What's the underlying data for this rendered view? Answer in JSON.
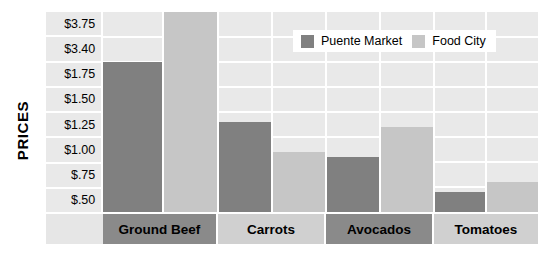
{
  "chart_data": {
    "type": "bar",
    "title": "",
    "subtitle": "",
    "xlabel": "",
    "ylabel": "PRICES",
    "categories": [
      "Ground Beef",
      "Carrots",
      "Avocados",
      "Tomatoes"
    ],
    "ytick_labels": [
      "$3.75",
      "$3.40",
      "$1.75",
      "$1.50",
      "$1.25",
      "$1.00",
      "$.75",
      "$.50"
    ],
    "grid": true,
    "legend_position": "top-right",
    "series": [
      {
        "name": "Puente Market",
        "color": "#808080",
        "values": [
          3.4,
          1.4,
          1.05,
          0.7
        ]
      },
      {
        "name": "Food City",
        "color": "#c6c6c6",
        "values": [
          3.8,
          1.1,
          1.35,
          0.8
        ]
      }
    ]
  },
  "axis": {
    "y_title": "PRICES"
  },
  "legend": {
    "items": [
      {
        "label": "Puente Market",
        "color": "#808080"
      },
      {
        "label": "Food City",
        "color": "#c6c6c6"
      }
    ]
  },
  "colors": {
    "puente_market": "#808080",
    "food_city": "#c6c6c6",
    "plot_background": "#e9e9e9",
    "gridline": "#ffffff",
    "label_row_dark": "#8a8a8a",
    "label_row_light": "#d0d0d0"
  }
}
